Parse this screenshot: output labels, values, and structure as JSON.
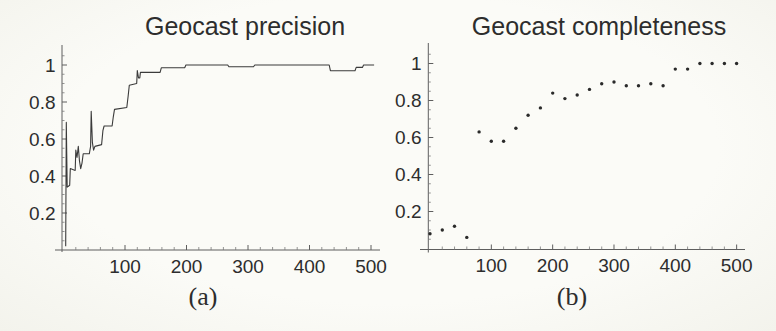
{
  "figure": {
    "background_color": "#f9f9f5",
    "ink_color": "#2d2d2d"
  },
  "chart_data": [
    {
      "id": "a",
      "type": "line",
      "title": "Geocast precision",
      "caption": "(a)",
      "xlabel": "",
      "ylabel": "",
      "xlim": [
        0,
        515
      ],
      "ylim": [
        0,
        1.08
      ],
      "grid": false,
      "legend": "none",
      "x_ticks": [
        100,
        200,
        300,
        400,
        500
      ],
      "x_tick_labels": [
        "100",
        "200",
        "300",
        "400",
        "500"
      ],
      "y_ticks": [
        0.2,
        0.4,
        0.6,
        0.8,
        1
      ],
      "y_tick_labels": [
        "0.2",
        "0.4",
        "0.6",
        "0.8",
        "1"
      ],
      "x_minor_tick_step": 20,
      "y_minor_tick_step": 0.05,
      "series": [
        {
          "name": "precision",
          "style": "line",
          "points": [
            [
              3.5,
              0.02
            ],
            [
              4.5,
              0.69
            ],
            [
              6,
              0.34
            ],
            [
              8,
              0.345
            ],
            [
              10,
              0.35
            ],
            [
              11,
              0.44
            ],
            [
              19,
              0.43
            ],
            [
              20,
              0.54
            ],
            [
              22,
              0.5
            ],
            [
              24,
              0.56
            ],
            [
              26,
              0.48
            ],
            [
              28,
              0.44
            ],
            [
              30,
              0.47
            ],
            [
              32,
              0.52
            ],
            [
              42,
              0.52
            ],
            [
              44,
              0.56
            ],
            [
              45,
              0.75
            ],
            [
              47,
              0.58
            ],
            [
              49,
              0.54
            ],
            [
              51,
              0.56
            ],
            [
              62,
              0.57
            ],
            [
              64,
              0.645
            ],
            [
              66,
              0.67
            ],
            [
              79,
              0.67
            ],
            [
              81,
              0.72
            ],
            [
              83,
              0.76
            ],
            [
              103,
              0.77
            ],
            [
              105,
              0.83
            ],
            [
              107,
              0.89
            ],
            [
              119,
              0.9
            ],
            [
              120,
              0.97
            ],
            [
              122,
              0.93
            ],
            [
              124,
              0.93
            ],
            [
              125,
              0.96
            ],
            [
              157,
              0.96
            ],
            [
              159,
              0.985
            ],
            [
              197,
              0.985
            ],
            [
              199,
              1.0
            ],
            [
              267,
              1.0
            ],
            [
              269,
              0.99
            ],
            [
              309,
              0.99
            ],
            [
              311,
              1.0
            ],
            [
              432,
              1.0
            ],
            [
              434,
              0.969
            ],
            [
              474,
              0.969
            ],
            [
              476,
              0.987
            ],
            [
              486,
              0.987
            ],
            [
              488,
              1.0
            ],
            [
              505,
              1.0
            ]
          ]
        }
      ]
    },
    {
      "id": "b",
      "type": "scatter",
      "title": "Geocast completeness",
      "caption": "(b)",
      "xlabel": "",
      "ylabel": "",
      "xlim": [
        0,
        515
      ],
      "ylim": [
        0,
        1.08
      ],
      "grid": false,
      "legend": "none",
      "x_ticks": [
        100,
        200,
        300,
        400,
        500
      ],
      "x_tick_labels": [
        "100",
        "200",
        "300",
        "400",
        "500"
      ],
      "y_ticks": [
        0.2,
        0.4,
        0.6,
        0.8,
        1
      ],
      "y_tick_labels": [
        "0.2",
        "0.4",
        "0.6",
        "0.8",
        "1"
      ],
      "x_minor_tick_step": 20,
      "y_minor_tick_step": 0.05,
      "series": [
        {
          "name": "completeness",
          "style": "points",
          "points": [
            [
              0,
              0.08
            ],
            [
              20,
              0.1
            ],
            [
              40,
              0.12
            ],
            [
              60,
              0.06
            ],
            [
              80,
              0.63
            ],
            [
              100,
              0.58
            ],
            [
              120,
              0.58
            ],
            [
              140,
              0.65
            ],
            [
              160,
              0.72
            ],
            [
              180,
              0.76
            ],
            [
              200,
              0.84
            ],
            [
              220,
              0.81
            ],
            [
              240,
              0.83
            ],
            [
              260,
              0.86
            ],
            [
              280,
              0.89
            ],
            [
              300,
              0.9
            ],
            [
              320,
              0.88
            ],
            [
              340,
              0.88
            ],
            [
              360,
              0.89
            ],
            [
              380,
              0.88
            ],
            [
              400,
              0.97
            ],
            [
              420,
              0.97
            ],
            [
              440,
              1.0
            ],
            [
              460,
              1.0
            ],
            [
              480,
              1.0
            ],
            [
              500,
              1.0
            ]
          ]
        }
      ]
    }
  ]
}
